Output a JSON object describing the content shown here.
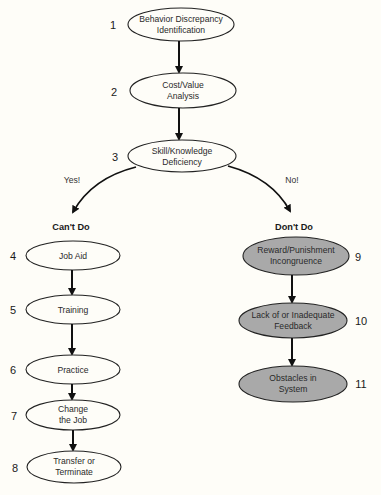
{
  "colors": {
    "background": "#fefdf8",
    "cant_do_fill": "#fefdf8",
    "dont_do_fill": "#a9a9a9",
    "stroke": "#222222"
  },
  "top_nodes": [
    {
      "number": "1",
      "line1": "Behavior Discrepancy",
      "line2": "Identification"
    },
    {
      "number": "2",
      "line1": "Cost/Value",
      "line2": "Analysis"
    },
    {
      "number": "3",
      "line1": "Skill/Knowledge",
      "line2": "Deficiency"
    }
  ],
  "branches": {
    "left": {
      "label": "Yes!",
      "heading": "Can't Do"
    },
    "right": {
      "label": "No!",
      "heading": "Don't Do"
    }
  },
  "cant_do_nodes": [
    {
      "number": "4",
      "line1": "Job Aid",
      "line2": ""
    },
    {
      "number": "5",
      "line1": "Training",
      "line2": ""
    },
    {
      "number": "6",
      "line1": "Practice",
      "line2": ""
    },
    {
      "number": "7",
      "line1": "Change",
      "line2": "the Job"
    },
    {
      "number": "8",
      "line1": "Transfer or",
      "line2": "Terminate"
    }
  ],
  "dont_do_nodes": [
    {
      "number": "9",
      "line1": "Reward/Punishment",
      "line2": "Incongruence"
    },
    {
      "number": "10",
      "line1": "Lack of or Inadequate",
      "line2": "Feedback"
    },
    {
      "number": "11",
      "line1": "Obstacles in",
      "line2": "System"
    }
  ]
}
